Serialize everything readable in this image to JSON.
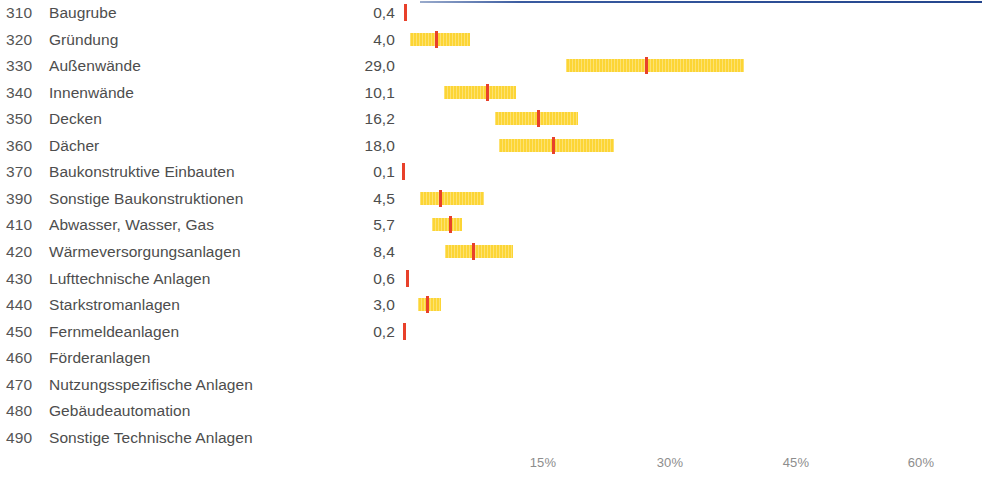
{
  "chart_data": {
    "type": "bar",
    "title": "",
    "subtitle": "",
    "xlabel": "",
    "ylabel": "",
    "xlim": [
      0,
      65
    ],
    "grid": false,
    "legend": null,
    "value_unit": "%",
    "decimal_separator": ",",
    "colors": {
      "bar_fill": "#fcd535",
      "marker": "#e8402a",
      "text": "#4d4d4d",
      "axis_text": "#8d8d8d",
      "top_rule": "#2d4f96"
    },
    "axis": {
      "ticks": [
        "15%",
        "30%",
        "45%",
        "60%"
      ],
      "tick_values": [
        15,
        30,
        45,
        60
      ]
    },
    "categories": [
      "Baugrube",
      "Gründung",
      "Außenwände",
      "Innenwände",
      "Decken",
      "Dächer",
      "Baukonstruktive Einbauten",
      "Sonstige Baukonstruktionen",
      "Abwasser, Wasser, Gas",
      "Wärmeversorgungsanlagen",
      "Lufttechnische Anlagen",
      "Starkstromanlagen",
      "Fernmeldeanlagen",
      "Förderanlagen",
      "Nutzungsspezifische Anlagen",
      "Gebäudeautomation",
      "Sonstige Technische Anlagen"
    ],
    "codes": [
      "310",
      "320",
      "330",
      "340",
      "350",
      "360",
      "370",
      "390",
      "410",
      "420",
      "430",
      "440",
      "450",
      "460",
      "470",
      "480",
      "490"
    ],
    "values": [
      0.4,
      4.0,
      29.0,
      10.1,
      16.2,
      18.0,
      0.1,
      4.5,
      5.7,
      8.4,
      0.6,
      3.0,
      0.2,
      null,
      null,
      null,
      null
    ],
    "value_labels": [
      "0,4",
      "4,0",
      "29,0",
      "10,1",
      "16,2",
      "18,0",
      "0,1",
      "4,5",
      "5,7",
      "8,4",
      "0,6",
      "3,0",
      "0,2",
      "",
      "",
      "",
      ""
    ],
    "ranges": [
      {
        "low": 0.4,
        "high": 0.4
      },
      {
        "low": 1.1,
        "high": 8.2
      },
      {
        "low": 19.6,
        "high": 40.8
      },
      {
        "low": 5.1,
        "high": 13.7
      },
      {
        "low": 11.2,
        "high": 21.1
      },
      {
        "low": 11.7,
        "high": 25.4
      },
      {
        "low": 0.1,
        "high": 0.1
      },
      {
        "low": 2.3,
        "high": 9.9
      },
      {
        "low": 3.7,
        "high": 7.3
      },
      {
        "low": 5.2,
        "high": 13.3
      },
      {
        "low": 0.6,
        "high": 0.6
      },
      {
        "low": 2.0,
        "high": 4.8
      },
      {
        "low": 0.2,
        "high": 0.2
      },
      {
        "low": null,
        "high": null
      },
      {
        "low": null,
        "high": null
      },
      {
        "low": null,
        "high": null
      },
      {
        "low": null,
        "high": null
      }
    ]
  },
  "rows": [
    {
      "code": "310",
      "label": "Baugrube",
      "value": "0,4"
    },
    {
      "code": "320",
      "label": "Gründung",
      "value": "4,0"
    },
    {
      "code": "330",
      "label": "Außenwände",
      "value": "29,0"
    },
    {
      "code": "340",
      "label": "Innenwände",
      "value": "10,1"
    },
    {
      "code": "350",
      "label": "Decken",
      "value": "16,2"
    },
    {
      "code": "360",
      "label": "Dächer",
      "value": "18,0"
    },
    {
      "code": "370",
      "label": "Baukonstruktive Einbauten",
      "value": "0,1"
    },
    {
      "code": "390",
      "label": "Sonstige Baukonstruktionen",
      "value": "4,5"
    },
    {
      "code": "410",
      "label": "Abwasser, Wasser, Gas",
      "value": "5,7"
    },
    {
      "code": "420",
      "label": "Wärmeversorgungsanlagen",
      "value": "8,4"
    },
    {
      "code": "430",
      "label": "Lufttechnische Anlagen",
      "value": "0,6"
    },
    {
      "code": "440",
      "label": "Starkstromanlagen",
      "value": "3,0"
    },
    {
      "code": "450",
      "label": "Fernmeldeanlagen",
      "value": "0,2"
    },
    {
      "code": "460",
      "label": "Förderanlagen",
      "value": ""
    },
    {
      "code": "470",
      "label": "Nutzungsspezifische Anlagen",
      "value": ""
    },
    {
      "code": "480",
      "label": "Gebäudeautomation",
      "value": ""
    },
    {
      "code": "490",
      "label": "Sonstige Technische Anlagen",
      "value": ""
    }
  ],
  "axis_ticks": [
    {
      "label": "15%"
    },
    {
      "label": "30%"
    },
    {
      "label": "45%"
    },
    {
      "label": "60%"
    }
  ]
}
